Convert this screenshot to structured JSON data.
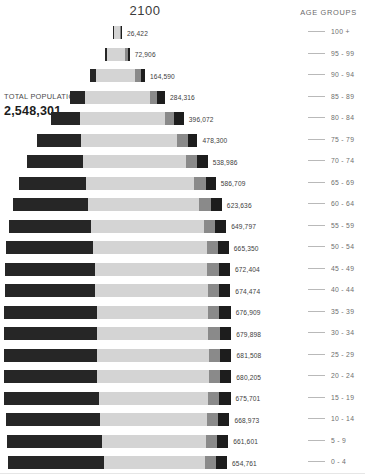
{
  "title": "2100",
  "total": {
    "label": "TOTAL POPULATION 65+",
    "value": "2,548,301"
  },
  "legend": {
    "title": "AGE GROUPS"
  },
  "colors": {
    "dark_left": "#262626",
    "light_body": "#d4d4d4",
    "mid_gray": "#8a8a8a",
    "dark_right": "#1d1d1d",
    "text": "#3d3d3d",
    "legend_text": "#6f6f6f",
    "background": "#ffffff"
  },
  "chart_data": {
    "type": "bar",
    "title": "2100",
    "xlabel": "",
    "ylabel": "Age groups",
    "orientation": "horizontal-centered",
    "grid": false,
    "legend_position": "right",
    "legend_title": "AGE GROUPS",
    "annotations": [
      "TOTAL POPULATION 65+",
      "2,548,301"
    ],
    "categories": [
      "100 +",
      "95 - 99",
      "90 - 94",
      "85 - 89",
      "80 - 84",
      "75 - 79",
      "70 - 74",
      "65 - 69",
      "60 - 64",
      "55 - 59",
      "50 - 54",
      "45 - 49",
      "40 - 44",
      "35 - 39",
      "30 - 34",
      "25 - 29",
      "20 - 24",
      "15 - 19",
      "10 - 14",
      "5 - 9",
      "0 - 4"
    ],
    "values": [
      26422,
      72906,
      164590,
      284316,
      396072,
      478300,
      538986,
      586709,
      623636,
      649797,
      665350,
      672404,
      674474,
      676909,
      679898,
      681508,
      680205,
      675701,
      668973,
      661601,
      654761
    ],
    "value_labels": [
      "26,422",
      "72,906",
      "164,590",
      "284,316",
      "396,072",
      "478,300",
      "538,986",
      "586,709",
      "623,636",
      "649,797",
      "665,350",
      "672,404",
      "674,474",
      "676,909",
      "679,898",
      "681,508",
      "680,205",
      "675,701",
      "668,973",
      "661,601",
      "654,761"
    ],
    "xlim": [
      0,
      700000
    ]
  },
  "rows": [
    {
      "age": "100 +",
      "label": "26,422",
      "total": 26422,
      "a": 0.08,
      "b": 0.72,
      "c": 0.12,
      "d": 0.08
    },
    {
      "age": "95 - 99",
      "label": "72,906",
      "total": 72906,
      "a": 0.08,
      "b": 0.74,
      "c": 0.1,
      "d": 0.08
    },
    {
      "age": "90 - 94",
      "label": "164,590",
      "total": 164590,
      "a": 0.11,
      "b": 0.71,
      "c": 0.1,
      "d": 0.08
    },
    {
      "age": "85 - 89",
      "label": "284,316",
      "total": 284316,
      "a": 0.16,
      "b": 0.68,
      "c": 0.08,
      "d": 0.08
    },
    {
      "age": "80 - 84",
      "label": "396,072",
      "total": 396072,
      "a": 0.22,
      "b": 0.64,
      "c": 0.07,
      "d": 0.07
    },
    {
      "age": "75 - 79",
      "label": "478,300",
      "total": 478300,
      "a": 0.27,
      "b": 0.6,
      "c": 0.07,
      "d": 0.06
    },
    {
      "age": "70 - 74",
      "label": "538,986",
      "total": 538986,
      "a": 0.31,
      "b": 0.57,
      "c": 0.06,
      "d": 0.06
    },
    {
      "age": "65 - 69",
      "label": "586,709",
      "total": 586709,
      "a": 0.34,
      "b": 0.55,
      "c": 0.06,
      "d": 0.05
    },
    {
      "age": "60 - 64",
      "label": "623,636",
      "total": 623636,
      "a": 0.36,
      "b": 0.53,
      "c": 0.06,
      "d": 0.05
    },
    {
      "age": "55 - 59",
      "label": "649,797",
      "total": 649797,
      "a": 0.38,
      "b": 0.52,
      "c": 0.05,
      "d": 0.05
    },
    {
      "age": "50 - 54",
      "label": "665,350",
      "total": 665350,
      "a": 0.39,
      "b": 0.51,
      "c": 0.05,
      "d": 0.05
    },
    {
      "age": "45 - 49",
      "label": "672,404",
      "total": 672404,
      "a": 0.4,
      "b": 0.5,
      "c": 0.05,
      "d": 0.05
    },
    {
      "age": "40 - 44",
      "label": "674,474",
      "total": 674474,
      "a": 0.4,
      "b": 0.5,
      "c": 0.05,
      "d": 0.05
    },
    {
      "age": "35 - 39",
      "label": "676,909",
      "total": 676909,
      "a": 0.41,
      "b": 0.49,
      "c": 0.05,
      "d": 0.05
    },
    {
      "age": "30 - 34",
      "label": "679,898",
      "total": 679898,
      "a": 0.41,
      "b": 0.49,
      "c": 0.05,
      "d": 0.05
    },
    {
      "age": "25 - 29",
      "label": "681,508",
      "total": 681508,
      "a": 0.41,
      "b": 0.49,
      "c": 0.05,
      "d": 0.05
    },
    {
      "age": "20 - 24",
      "label": "680,205",
      "total": 680205,
      "a": 0.41,
      "b": 0.49,
      "c": 0.05,
      "d": 0.05
    },
    {
      "age": "15 - 19",
      "label": "675,701",
      "total": 675701,
      "a": 0.42,
      "b": 0.48,
      "c": 0.05,
      "d": 0.05
    },
    {
      "age": "10 - 14",
      "label": "668,973",
      "total": 668973,
      "a": 0.42,
      "b": 0.48,
      "c": 0.05,
      "d": 0.05
    },
    {
      "age": "5 - 9",
      "label": "661,601",
      "total": 661601,
      "a": 0.43,
      "b": 0.47,
      "c": 0.05,
      "d": 0.05
    },
    {
      "age": "0 - 4",
      "label": "654,761",
      "total": 654761,
      "a": 0.44,
      "b": 0.46,
      "c": 0.05,
      "d": 0.05
    }
  ]
}
